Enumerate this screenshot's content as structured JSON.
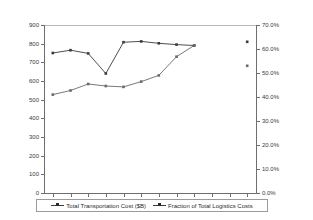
{
  "chart_data": {
    "type": "line",
    "title": "",
    "xlabel": "",
    "ylabel": "",
    "categories": [
      "1998",
      "1999",
      "2000",
      "2001",
      "2002",
      "2003",
      "2004",
      "2005",
      "2006",
      "2007",
      "2008",
      "2009"
    ],
    "left_axis": {
      "label": "",
      "ylim": [
        0,
        900
      ],
      "ticks": [
        "0",
        "100",
        "200",
        "300",
        "400",
        "500",
        "600",
        "700",
        "800",
        "900"
      ],
      "tick_values": [
        0,
        100,
        200,
        300,
        400,
        500,
        600,
        700,
        800,
        900
      ]
    },
    "right_axis": {
      "label": "",
      "ylim": [
        0,
        70
      ],
      "ticks": [
        "0.0%",
        "10.0%",
        "20.0%",
        "30.0%",
        "40.0%",
        "50.0%",
        "60.0%",
        "70.0%"
      ],
      "tick_values": [
        0,
        10,
        20,
        30,
        40,
        50,
        60,
        70
      ]
    },
    "grid": false,
    "legend_position": "bottom",
    "series": [
      {
        "name": "Total Transportation Cost ($B)",
        "axis": "left",
        "marker": "square",
        "color": "#3b3b3b",
        "x": [
          "1998",
          "1999",
          "2000",
          "2001",
          "2002",
          "2003",
          "2004",
          "2005",
          "2006"
        ],
        "values": [
          750,
          765,
          748,
          640,
          808,
          812,
          802,
          795,
          790
        ]
      },
      {
        "name": "Fraction of Total Logistics Costs",
        "axis": "right",
        "marker": "square",
        "color": "#6a6a6a",
        "x": [
          "1998",
          "1999",
          "2000",
          "2001",
          "2002",
          "2003",
          "2004",
          "2005",
          "2006"
        ],
        "values": [
          41.0,
          42.7,
          45.4,
          44.6,
          44.2,
          46.4,
          49.0,
          56.8,
          61.5
        ]
      },
      {
        "name": "Fraction of Total Logistics Costs",
        "axis": "right",
        "marker": "square",
        "isolated": true,
        "color": "#3b3b3b",
        "x": [
          "2009"
        ],
        "values": [
          63.0
        ]
      },
      {
        "name": "Fraction of Total Logistics Costs",
        "axis": "right",
        "marker": "square",
        "isolated": true,
        "color": "#6a6a6a",
        "x": [
          "2009"
        ],
        "values": [
          53.0
        ]
      }
    ]
  },
  "legend": {
    "items": [
      {
        "label": "Total Transportation Cost ($B)"
      },
      {
        "label": "Fraction of Total Logistics Costs"
      }
    ]
  }
}
